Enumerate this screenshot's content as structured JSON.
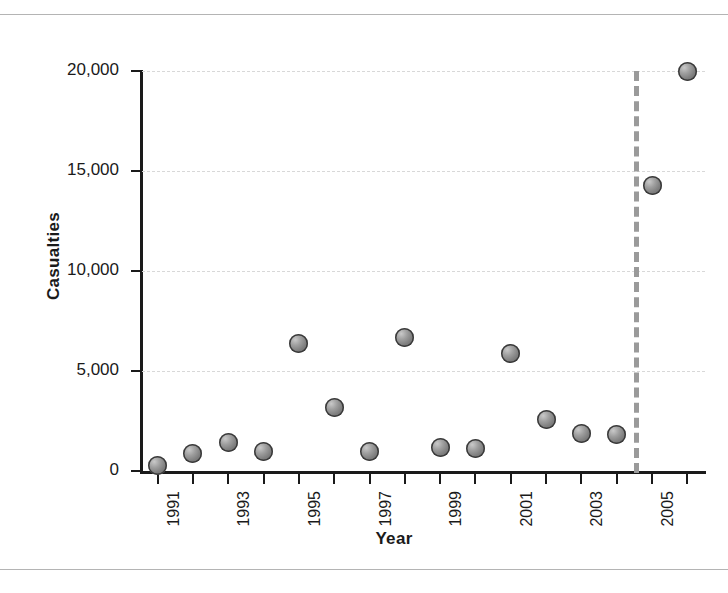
{
  "chart_data": {
    "type": "scatter",
    "title": "",
    "xlabel": "Year",
    "ylabel": "Casualties",
    "x": [
      1991,
      1992,
      1993,
      1994,
      1995,
      1996,
      1997,
      1998,
      1999,
      2000,
      2001,
      2002,
      2003,
      2004,
      2005,
      2006
    ],
    "values": [
      300,
      900,
      1450,
      1000,
      6400,
      3200,
      1000,
      6700,
      1200,
      1150,
      5900,
      2600,
      1900,
      1850,
      14300,
      20000
    ],
    "series": [
      {
        "name": "Casualties",
        "marker": "sphere-gray",
        "points": [
          {
            "x": 1991,
            "y": 300
          },
          {
            "x": 1992,
            "y": 900
          },
          {
            "x": 1993,
            "y": 1450
          },
          {
            "x": 1994,
            "y": 1000
          },
          {
            "x": 1995,
            "y": 6400
          },
          {
            "x": 1996,
            "y": 3200
          },
          {
            "x": 1997,
            "y": 1000
          },
          {
            "x": 1998,
            "y": 6700
          },
          {
            "x": 1999,
            "y": 1200
          },
          {
            "x": 2000,
            "y": 1150
          },
          {
            "x": 2001,
            "y": 5900
          },
          {
            "x": 2002,
            "y": 2600
          },
          {
            "x": 2003,
            "y": 1900
          },
          {
            "x": 2004,
            "y": 1850
          },
          {
            "x": 2005,
            "y": 14300
          },
          {
            "x": 2006,
            "y": 20000
          }
        ]
      }
    ],
    "xlim": [
      1990.5,
      2006.5
    ],
    "ylim": [
      0,
      20000
    ],
    "ytick_values": [
      0,
      5000,
      10000,
      15000,
      20000
    ],
    "ytick_labels": [
      "0",
      "5,000",
      "10,000",
      "15,000",
      "20,000"
    ],
    "xtick_values": [
      1991,
      1992,
      1993,
      1994,
      1995,
      1996,
      1997,
      1998,
      1999,
      2000,
      2001,
      2002,
      2003,
      2004,
      2005,
      2006
    ],
    "xtick_labels": [
      "1991",
      "",
      "1993",
      "",
      "1995",
      "",
      "1997",
      "",
      "1999",
      "",
      "2001",
      "",
      "2003",
      "",
      "2005",
      ""
    ],
    "xtick_label_rotation": 90,
    "grid": "horizontal-dotted",
    "legend": "none",
    "annotations": [
      {
        "type": "vertical-line",
        "style": "dashed",
        "color": "#9a9a9a",
        "x": 2004.5
      }
    ]
  },
  "colors": {
    "marker_fill": "#808080",
    "marker_edge": "#3a3a3a",
    "axis": "#1a1a1a",
    "gridline": "#d8d8d8",
    "event_line": "#9a9a9a",
    "frame_rule": "#b4b4b4",
    "background": "#ffffff"
  }
}
